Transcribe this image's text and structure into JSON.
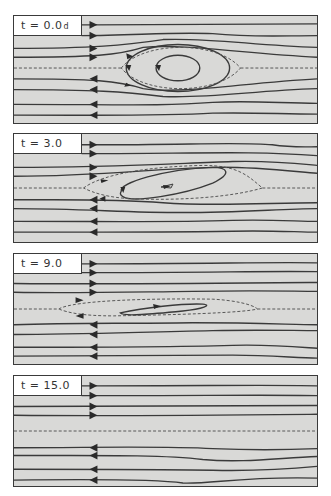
{
  "figure": {
    "colors": {
      "panel_bg": "#d9d9d7",
      "line": "#3a3a3a",
      "dashed": "#555555",
      "label_bg": "#ffffff"
    },
    "panels": [
      {
        "label_prefix": "t  =  ",
        "time": "0.0",
        "unit": "d",
        "top": 15,
        "height": 109,
        "flow_lines_upper_right": [
          9,
          20,
          33,
          42
        ],
        "separatrix_y": 53,
        "flow_lines_lower_left": [
          64,
          75,
          90,
          101
        ],
        "arrow_x": 80,
        "vortex": "circular eddy with inner closed loop and dashed separatrix (cat's eye)"
      },
      {
        "label_prefix": "t  =  ",
        "time": "3.0",
        "unit": "",
        "top": 133,
        "height": 110,
        "flow_lines_upper_right": [
          11,
          20,
          34,
          43
        ],
        "separatrix_y": 55,
        "flow_lines_lower_left": [
          67,
          76,
          89,
          100
        ],
        "arrow_x": 80,
        "vortex": "tilted elongated eddy with small inner loop"
      },
      {
        "label_prefix": "t  =  ",
        "time": "9.0",
        "unit": "",
        "top": 253,
        "height": 112,
        "flow_lines_upper_right": [
          10,
          19,
          31,
          40
        ],
        "separatrix_y": 56,
        "flow_lines_lower_left": [
          72,
          80,
          95,
          106
        ],
        "arrow_x": 80,
        "vortex": "thin stretched filament"
      },
      {
        "label_prefix": "t  =  ",
        "time": "15.0",
        "unit": "",
        "top": 375,
        "height": 112,
        "flow_lines_upper_right": [
          10,
          20,
          31,
          40
        ],
        "separatrix_y": 56,
        "flow_lines_lower_left": [
          73,
          81,
          95,
          106
        ],
        "arrow_x": 80,
        "vortex": "none (fully decayed; plain shear flow)"
      }
    ]
  }
}
